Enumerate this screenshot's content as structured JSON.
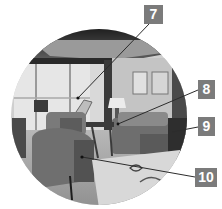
{
  "figure": {
    "type": "circular-photo-with-callouts",
    "colors": {
      "label_background": "#7b7b7b",
      "label_text": "#ffffff",
      "leader_line": "#333333"
    }
  },
  "callouts": [
    {
      "number": "7",
      "label_x": 144,
      "label_y": 5,
      "target": [
        78,
        98
      ]
    },
    {
      "number": "8",
      "label_x": 198,
      "label_y": 80,
      "target": [
        118,
        124
      ]
    },
    {
      "number": "9",
      "label_x": 198,
      "label_y": 117,
      "target": [
        172,
        132
      ]
    },
    {
      "number": "10",
      "label_x": 195,
      "label_y": 168,
      "target": [
        82,
        157
      ]
    }
  ]
}
